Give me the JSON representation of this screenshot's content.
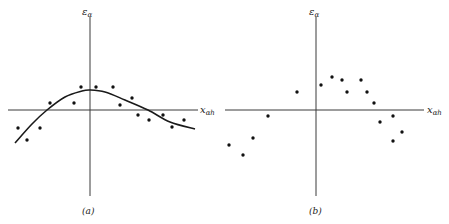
{
  "figure": {
    "panels": [
      {
        "id": "a",
        "caption": "(a)",
        "y_axis_label": "ε",
        "y_axis_sub": "α",
        "x_axis_label": "x",
        "x_axis_sub": "αh"
      },
      {
        "id": "b",
        "caption": "(b)",
        "y_axis_label": "ε",
        "y_axis_sub": "α",
        "x_axis_label": "x",
        "x_axis_sub": "αh"
      }
    ]
  },
  "chart_data": [
    {
      "type": "scatter",
      "title": "(a)",
      "xlabel": "x_αh",
      "ylabel": "ε_α",
      "grid": false,
      "axis_ticks": false,
      "note": "Residuals with systematic trend; smooth fitted curve overlaid. Coordinates in pixel units relative to axis origin (x right positive, y up positive).",
      "points": [
        {
          "x": -72,
          "y": -18
        },
        {
          "x": -63,
          "y": -30
        },
        {
          "x": -50,
          "y": -18
        },
        {
          "x": -40,
          "y": 7
        },
        {
          "x": -16,
          "y": 7
        },
        {
          "x": -9,
          "y": 23
        },
        {
          "x": 6,
          "y": 23
        },
        {
          "x": 23,
          "y": 23
        },
        {
          "x": 30,
          "y": 5
        },
        {
          "x": 42,
          "y": 12
        },
        {
          "x": 48,
          "y": -5
        },
        {
          "x": 59,
          "y": -10
        },
        {
          "x": 73,
          "y": -5
        },
        {
          "x": 82,
          "y": -17
        },
        {
          "x": 94,
          "y": -10
        }
      ],
      "curve": [
        {
          "x": -75,
          "y": -33
        },
        {
          "x": -58,
          "y": -14
        },
        {
          "x": -43,
          "y": 0
        },
        {
          "x": -25,
          "y": 13
        },
        {
          "x": -8,
          "y": 19
        },
        {
          "x": 0,
          "y": 20
        },
        {
          "x": 15,
          "y": 18
        },
        {
          "x": 35,
          "y": 10
        },
        {
          "x": 58,
          "y": 0
        },
        {
          "x": 80,
          "y": -12
        },
        {
          "x": 105,
          "y": -19
        }
      ]
    },
    {
      "type": "scatter",
      "title": "(b)",
      "xlabel": "x_αh",
      "ylabel": "ε_α",
      "grid": false,
      "axis_ticks": false,
      "note": "Residuals with no fitted curve. Coordinates in pixel units relative to axis origin.",
      "points": [
        {
          "x": -87,
          "y": -35
        },
        {
          "x": -73,
          "y": -45
        },
        {
          "x": -63,
          "y": -28
        },
        {
          "x": -48,
          "y": -6
        },
        {
          "x": -19,
          "y": 18
        },
        {
          "x": 5,
          "y": 25
        },
        {
          "x": 16,
          "y": 33
        },
        {
          "x": 26,
          "y": 30
        },
        {
          "x": 31,
          "y": 18
        },
        {
          "x": 45,
          "y": 30
        },
        {
          "x": 51,
          "y": 18
        },
        {
          "x": 58,
          "y": 7
        },
        {
          "x": 64,
          "y": -12
        },
        {
          "x": 77,
          "y": -6
        },
        {
          "x": 77,
          "y": -31
        },
        {
          "x": 86,
          "y": -22
        }
      ]
    }
  ]
}
